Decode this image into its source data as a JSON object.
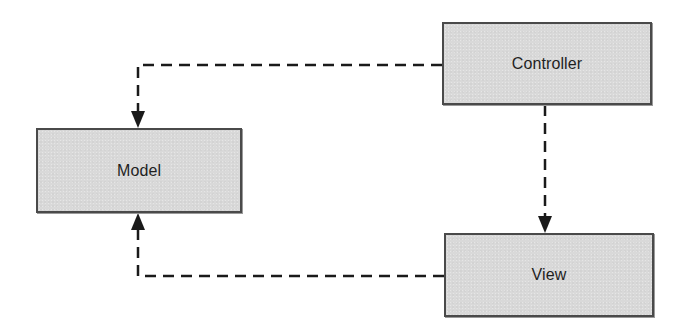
{
  "diagram": {
    "type": "flowchart",
    "title": "",
    "style": {
      "node_fill": "#d9d9d9",
      "node_border": "#4a4a4a",
      "edge_color": "#1a1a1a",
      "edge_style": "dashed",
      "text_color": "#1f1f1f",
      "background": "#ffffff"
    },
    "nodes": [
      {
        "id": "controller",
        "label": "Controller"
      },
      {
        "id": "model",
        "label": "Model"
      },
      {
        "id": "view",
        "label": "View"
      }
    ],
    "edges": [
      {
        "from": "controller",
        "to": "model",
        "style": "dashed",
        "arrow": "end"
      },
      {
        "from": "controller",
        "to": "view",
        "style": "dashed",
        "arrow": "end"
      },
      {
        "from": "view",
        "to": "model",
        "style": "dashed",
        "arrow": "end"
      }
    ]
  }
}
